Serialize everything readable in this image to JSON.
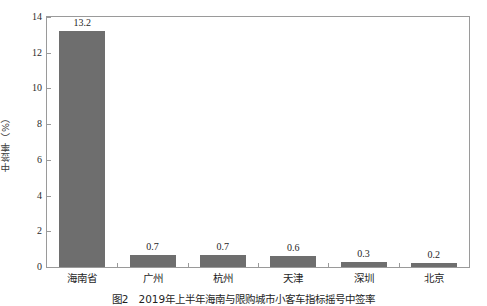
{
  "chart_data": {
    "type": "bar",
    "title": "",
    "subtitle": "",
    "xlabel": "",
    "ylabel": "中签率（%）",
    "categories": [
      "海南省",
      "广州",
      "杭州",
      "天津",
      "深圳",
      "北京"
    ],
    "values": [
      13.2,
      0.7,
      0.7,
      0.6,
      0.3,
      0.2
    ],
    "value_labels": [
      "13.2",
      "0.7",
      "0.7",
      "0.6",
      "0.3",
      "0.2"
    ],
    "series": [
      {
        "name": "中签率",
        "values": [
          13.2,
          0.7,
          0.7,
          0.6,
          0.3,
          0.2
        ],
        "color": "#6e6e6e"
      }
    ],
    "ylim": [
      0,
      14
    ],
    "ytick_values": [
      0,
      2,
      4,
      6,
      8,
      10,
      12,
      14
    ],
    "ytick_labels": [
      "0",
      "2",
      "4",
      "6",
      "8",
      "10",
      "12",
      "14"
    ],
    "grid": false,
    "legend": false,
    "legend_position": "none",
    "bar_color": "#6e6e6e",
    "frame_color": "#9a9a9a",
    "background": "#ffffff",
    "orientation": "vertical"
  },
  "caption": {
    "text": "图2　2019年上半年海南与限购城市小客车指标摇号中签率"
  }
}
